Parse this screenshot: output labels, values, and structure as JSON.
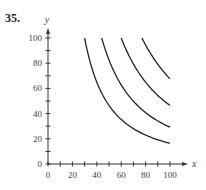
{
  "problem_number": "35.",
  "chart_data": {
    "type": "line",
    "title": "",
    "xlabel": "x",
    "ylabel": "y",
    "xlim": [
      0,
      100
    ],
    "ylim": [
      0,
      100
    ],
    "x_ticks": [
      0,
      20,
      40,
      60,
      80,
      100
    ],
    "y_ticks": [
      0,
      20,
      40,
      60,
      80,
      100
    ],
    "x_minor_step": 10,
    "y_minor_step": 10,
    "grid": false,
    "legend": null,
    "series": [
      {
        "name": "curve 1",
        "x": [
          30,
          40,
          50,
          60,
          70,
          80,
          90,
          100
        ],
        "y": [
          100,
          65,
          46.5,
          35.4,
          28.1,
          23.0,
          19.2,
          16.4
        ]
      },
      {
        "name": "curve 2",
        "x": [
          44,
          50,
          60,
          70,
          80,
          90,
          100
        ],
        "y": [
          100,
          82.5,
          62.8,
          49.8,
          40.8,
          34.2,
          29.2
        ]
      },
      {
        "name": "curve 3",
        "x": [
          60,
          70,
          80,
          90,
          100
        ],
        "y": [
          100,
          79.4,
          65.0,
          54.4,
          46.5
        ]
      },
      {
        "name": "curve 4",
        "x": [
          77,
          80,
          90,
          100
        ],
        "y": [
          100,
          94.4,
          79.2,
          67.6
        ]
      }
    ],
    "curve_form": "y = C / x^1.5",
    "curve_start_x": [
      30,
      44,
      60,
      77
    ],
    "curve_end_x": 100
  }
}
